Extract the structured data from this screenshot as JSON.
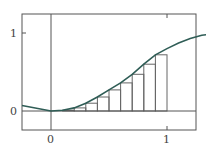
{
  "chart_data": {
    "type": "line",
    "title": "",
    "xlabel": "",
    "ylabel": "",
    "xlim": [
      -0.25,
      1.5
    ],
    "ylim": [
      -0.24,
      1.24
    ],
    "grid": false,
    "x_ticks": [
      "0",
      "1"
    ],
    "y_ticks": [
      "0",
      "1"
    ],
    "series": [
      {
        "name": "curve",
        "x": [
          -0.25,
          0,
          0.1,
          0.2,
          0.3,
          0.4,
          0.5,
          0.6,
          0.7,
          0.8,
          0.9,
          1.0,
          1.1,
          1.2,
          1.3,
          1.4,
          1.5
        ],
        "values": [
          0.07,
          0.0,
          0.01,
          0.04,
          0.1,
          0.18,
          0.27,
          0.36,
          0.47,
          0.6,
          0.72,
          0.8,
          0.87,
          0.93,
          0.97,
          0.99,
          1.0
        ]
      }
    ],
    "rectangles": {
      "x_left": [
        0.1,
        0.2,
        0.3,
        0.4,
        0.5,
        0.6,
        0.7,
        0.8,
        0.9
      ],
      "width": 0.1,
      "heights": [
        0.01,
        0.04,
        0.1,
        0.18,
        0.27,
        0.36,
        0.47,
        0.6,
        0.72
      ]
    },
    "colors": {
      "curve": "#2f5d56",
      "frame": "#555555",
      "rect": "#666666"
    }
  }
}
